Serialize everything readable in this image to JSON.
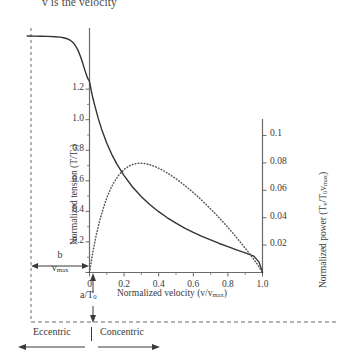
{
  "caption": {
    "top_text": "v is the velocity"
  },
  "chart_data": {
    "type": "line",
    "title": "",
    "xlabel": "Normalized velocity (v/vmax)",
    "xlabel_parts": {
      "main": "Normalized velocity (v/v",
      "sub": "max",
      "tail": ")"
    },
    "ylabel_left_parts": {
      "main": "Normalized tension (T/T",
      "sub": "0",
      "tail": ")"
    },
    "ylabel_right_parts": {
      "main": "Normalized power (T",
      "sub1": "v",
      "mid": "/T",
      "sub2": "0",
      "mid2": "v",
      "sub3": "max",
      "tail": ")"
    },
    "xlim": [
      -0.36,
      1.0
    ],
    "ylim_left": [
      0,
      1.6
    ],
    "ylim_right": [
      0,
      0.112
    ],
    "x_ticks": [
      0,
      0.2,
      0.4,
      0.6,
      0.8,
      1.0
    ],
    "x_tick_labels": [
      "0",
      "0.2",
      "0.4",
      "0.6",
      "0.8",
      "1.0"
    ],
    "y_left_ticks": [
      0,
      0.2,
      0.4,
      0.6,
      0.8,
      1.0,
      1.2
    ],
    "y_left_tick_labels": [
      "0",
      "0.2",
      "0.4",
      "0.6",
      "0.8",
      "1.0",
      "1.2"
    ],
    "y_right_ticks": [
      0.02,
      0.04,
      0.06,
      0.08,
      0.1
    ],
    "y_right_tick_labels": [
      "0.02",
      "0.04",
      "0.06",
      "0.08",
      "0.1"
    ],
    "grid": false,
    "legend": "none",
    "series": [
      {
        "name": "Normalized tension",
        "style": "solid",
        "axis": "left",
        "color": "#333333",
        "points": [
          [
            -0.36,
            1.548
          ],
          [
            -0.32,
            1.547
          ],
          [
            -0.28,
            1.546
          ],
          [
            -0.24,
            1.545
          ],
          [
            -0.2,
            1.543
          ],
          [
            -0.17,
            1.54
          ],
          [
            -0.15,
            1.536
          ],
          [
            -0.13,
            1.53
          ],
          [
            -0.115,
            1.522
          ],
          [
            -0.1,
            1.51
          ],
          [
            -0.09,
            1.498
          ],
          [
            -0.08,
            1.482
          ],
          [
            -0.07,
            1.462
          ],
          [
            -0.06,
            1.437
          ],
          [
            -0.05,
            1.407
          ],
          [
            -0.04,
            1.372
          ],
          [
            -0.03,
            1.336
          ],
          [
            -0.02,
            1.3
          ],
          [
            -0.01,
            1.27
          ],
          [
            0.0,
            1.25
          ],
          [
            0.01,
            1.19
          ],
          [
            0.02,
            1.14
          ],
          [
            0.03,
            1.095
          ],
          [
            0.05,
            1.01
          ],
          [
            0.07,
            0.938
          ],
          [
            0.1,
            0.846
          ],
          [
            0.13,
            0.77
          ],
          [
            0.16,
            0.706
          ],
          [
            0.2,
            0.634
          ],
          [
            0.25,
            0.558
          ],
          [
            0.3,
            0.496
          ],
          [
            0.35,
            0.443
          ],
          [
            0.4,
            0.398
          ],
          [
            0.45,
            0.358
          ],
          [
            0.5,
            0.323
          ],
          [
            0.55,
            0.291
          ],
          [
            0.6,
            0.263
          ],
          [
            0.65,
            0.237
          ],
          [
            0.7,
            0.213
          ],
          [
            0.75,
            0.19
          ],
          [
            0.8,
            0.169
          ],
          [
            0.85,
            0.148
          ],
          [
            0.9,
            0.128
          ],
          [
            0.95,
            0.107
          ],
          [
            0.98,
            0.068
          ],
          [
            1.0,
            0.0
          ]
        ]
      },
      {
        "name": "Normalized power",
        "style": "dotted",
        "axis": "right",
        "color": "#555555",
        "points": [
          [
            0.0,
            0.0
          ],
          [
            0.02,
            0.0155
          ],
          [
            0.04,
            0.028
          ],
          [
            0.06,
            0.0385
          ],
          [
            0.08,
            0.047
          ],
          [
            0.1,
            0.0545
          ],
          [
            0.12,
            0.0605
          ],
          [
            0.14,
            0.0655
          ],
          [
            0.17,
            0.0712
          ],
          [
            0.2,
            0.0752
          ],
          [
            0.23,
            0.0778
          ],
          [
            0.26,
            0.0793
          ],
          [
            0.29,
            0.0798
          ],
          [
            0.32,
            0.0795
          ],
          [
            0.35,
            0.0786
          ],
          [
            0.38,
            0.0772
          ],
          [
            0.42,
            0.0748
          ],
          [
            0.46,
            0.0718
          ],
          [
            0.5,
            0.0684
          ],
          [
            0.54,
            0.0646
          ],
          [
            0.58,
            0.0605
          ],
          [
            0.62,
            0.0561
          ],
          [
            0.66,
            0.0514
          ],
          [
            0.7,
            0.0464
          ],
          [
            0.74,
            0.0412
          ],
          [
            0.78,
            0.0357
          ],
          [
            0.82,
            0.03
          ],
          [
            0.86,
            0.024
          ],
          [
            0.9,
            0.0178
          ],
          [
            0.94,
            0.0113
          ],
          [
            0.97,
            0.006
          ],
          [
            1.0,
            0.0
          ]
        ]
      }
    ],
    "annotations": {
      "b_over_vmax": {
        "num": "b",
        "den": "v",
        "den_sub": "max"
      },
      "a_over_t0": {
        "num": "a",
        "den": "T",
        "den_sub": "0"
      },
      "eccentric": "Eccentric",
      "concentric": "Concentric"
    }
  },
  "colors": {
    "tension_curve": "#333333",
    "power_curve": "#555555",
    "axis": "#6b6b6b",
    "dashed_guide": "#6b6b6b",
    "text": "#3a3a3a"
  }
}
